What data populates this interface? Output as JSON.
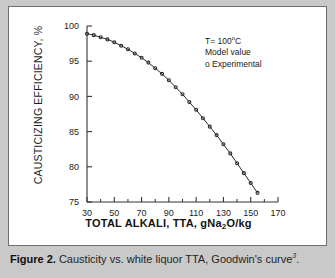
{
  "figure": {
    "caption_prefix": "Figure 2.",
    "caption_text": "Causticity vs. white liquor TTA, Goodwin's curve",
    "caption_superscript": "3",
    "caption_suffix": "."
  },
  "legend": {
    "temperature_prefix": "T= 100",
    "temperature_degree": "o",
    "temperature_unit": "C",
    "model_label": "Model value",
    "experimental_label": "o Experimental"
  },
  "chart_data": {
    "type": "line",
    "title": "",
    "xlabel": "TOTAL ALKALI, TTA, gNa2O/kg",
    "xlabel_parts": {
      "pre": "TOTAL ALKALI, TTA, gNa",
      "sub": "2",
      "post": "O/kg"
    },
    "ylabel": "CAUSTICIZING EFFICIENCY, %",
    "xlim": [
      30,
      170
    ],
    "ylim": [
      75,
      100
    ],
    "xticks": [
      30,
      50,
      70,
      90,
      110,
      130,
      150,
      170
    ],
    "xtick_labels": [
      "30",
      "50",
      "70",
      "90",
      "110",
      "130",
      "150",
      "170"
    ],
    "xticks_minor": [
      40,
      60,
      80,
      100,
      120,
      140,
      160
    ],
    "yticks": [
      75,
      80,
      85,
      90,
      95,
      100
    ],
    "ytick_labels": [
      "75",
      "80",
      "85",
      "90",
      "95",
      "100"
    ],
    "grid": false,
    "legend_position": "upper-right-inside",
    "series": [
      {
        "name": "Model value",
        "style": "line",
        "color": "#2a2a2a",
        "x": [
          30,
          35,
          40,
          45,
          50,
          55,
          60,
          65,
          70,
          75,
          80,
          85,
          90,
          95,
          100,
          105,
          110,
          115,
          120,
          125,
          130,
          135,
          140,
          145,
          150,
          155,
          160,
          165,
          170
        ],
        "y": [
          98.9,
          98.7,
          98.4,
          98.1,
          97.7,
          97.2,
          96.7,
          96.1,
          95.5,
          94.8,
          94.0,
          93.2,
          92.3,
          91.3,
          90.3,
          89.2,
          88.1,
          86.9,
          85.7,
          84.5,
          83.2,
          81.9,
          80.5,
          79.1,
          77.7,
          76.3,
          74.8,
          73.4,
          71.9
        ]
      },
      {
        "name": "Experimental",
        "style": "markers",
        "marker": "o",
        "color": "#2a2a2a",
        "x": [
          30,
          35,
          40,
          45,
          50,
          55,
          60,
          65,
          70,
          75,
          80,
          85,
          90,
          95,
          100,
          105,
          110,
          115,
          120,
          125,
          130,
          135,
          140,
          145,
          150,
          155,
          160,
          165
        ],
        "y": [
          98.9,
          98.7,
          98.4,
          98.1,
          97.7,
          97.2,
          96.7,
          96.1,
          95.5,
          94.8,
          94.0,
          93.2,
          92.3,
          91.3,
          90.3,
          89.2,
          88.1,
          86.9,
          85.7,
          84.5,
          83.2,
          81.9,
          80.5,
          79.1,
          77.7,
          76.3,
          74.8,
          73.4
        ]
      }
    ]
  }
}
